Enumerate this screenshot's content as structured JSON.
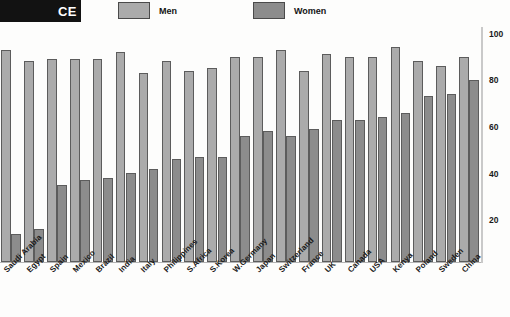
{
  "banner": {
    "text": "CE"
  },
  "legend": {
    "position": "top",
    "items": [
      {
        "label": "Men",
        "color": "#ababab",
        "icon": "legend-swatch-icon"
      },
      {
        "label": "Women",
        "color": "#8c8c8c",
        "icon": "legend-swatch-icon"
      }
    ]
  },
  "axis": {
    "tick_labels": [
      "100",
      "80",
      "60",
      "40",
      "20"
    ]
  },
  "chart_data": {
    "type": "bar",
    "title": "CE",
    "xlabel": "",
    "ylabel": "",
    "ylim": [
      0,
      100
    ],
    "yticks": [
      20,
      40,
      60,
      80,
      100
    ],
    "grid": false,
    "legend_position": "top",
    "categories": [
      "Saudi Arabia",
      "Egypt",
      "Spain",
      "Mexico",
      "Brazil",
      "India",
      "Italy",
      "Philippines",
      "S.Africa",
      "S.Korea",
      "W.Germany",
      "Japan",
      "Switzerland",
      "France",
      "UK",
      "Canada",
      "USA",
      "Kenya",
      "Poland",
      "Sweden",
      "China"
    ],
    "series": [
      {
        "name": "Men",
        "color": "#ababab",
        "values": [
          91,
          86,
          87,
          87,
          87,
          90,
          81,
          86,
          82,
          83,
          88,
          88,
          91,
          82,
          89,
          88,
          88,
          92,
          86,
          84,
          88
        ]
      },
      {
        "name": "Women",
        "color": "#8c8c8c",
        "values": [
          12,
          14,
          33,
          35,
          36,
          38,
          40,
          44,
          45,
          45,
          54,
          56,
          54,
          57,
          61,
          61,
          62,
          64,
          71,
          72,
          78
        ]
      }
    ]
  }
}
